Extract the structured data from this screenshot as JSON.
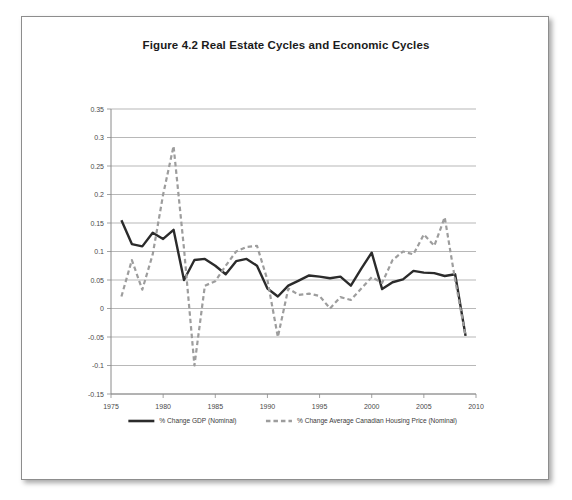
{
  "figure": {
    "title": "Figure 4.2 Real Estate Cycles and Economic Cycles"
  },
  "chart_data": {
    "type": "line",
    "title": "Figure 4.2 Real Estate Cycles and Economic Cycles",
    "xlabel": "",
    "ylabel": "",
    "xlim": [
      1975,
      2010
    ],
    "ylim": [
      -0.15,
      0.35
    ],
    "grid": true,
    "legend_position": "bottom",
    "x_ticks": [
      1975,
      1980,
      1985,
      1990,
      1995,
      2000,
      2005,
      2010
    ],
    "y_ticks": [
      -0.15,
      -0.1,
      -0.05,
      0,
      0.05,
      0.1,
      0.15,
      0.2,
      0.25,
      0.3,
      0.35
    ],
    "x": [
      1976,
      1977,
      1978,
      1979,
      1980,
      1981,
      1982,
      1983,
      1984,
      1985,
      1986,
      1987,
      1988,
      1989,
      1990,
      1991,
      1992,
      1993,
      1994,
      1995,
      1996,
      1997,
      1998,
      1999,
      2000,
      2001,
      2002,
      2003,
      2004,
      2005,
      2006,
      2007,
      2008,
      2009
    ],
    "series": [
      {
        "name": "% Change GDP (Nominal)",
        "key": "gdp",
        "color": "#2b2b2b",
        "style": "solid",
        "width": 2.4,
        "values": [
          0.155,
          0.113,
          0.109,
          0.133,
          0.122,
          0.138,
          0.05,
          0.085,
          0.087,
          0.075,
          0.06,
          0.083,
          0.087,
          0.075,
          0.035,
          0.021,
          0.04,
          0.049,
          0.058,
          0.056,
          0.053,
          0.056,
          0.04,
          0.07,
          0.098,
          0.034,
          0.046,
          0.051,
          0.066,
          0.063,
          0.062,
          0.057,
          0.06,
          -0.048
        ]
      },
      {
        "name": "% Change Average Canadian Housing Price (Nominal)",
        "key": "housing",
        "color": "#9d9d9d",
        "style": "dashed",
        "width": 2.2,
        "values": [
          0.021,
          0.085,
          0.033,
          0.095,
          0.2,
          0.285,
          0.105,
          -0.1,
          0.04,
          0.048,
          0.075,
          0.1,
          0.108,
          0.11,
          0.05,
          -0.05,
          0.035,
          0.024,
          0.026,
          0.022,
          0.0,
          0.02,
          0.015,
          0.035,
          0.055,
          0.045,
          0.085,
          0.1,
          0.095,
          0.13,
          0.11,
          0.16,
          0.05,
          -0.048
        ]
      }
    ]
  },
  "legend": {
    "items": [
      {
        "label": "% Change GDP (Nominal)",
        "style": "solid",
        "color": "#2b2b2b"
      },
      {
        "label": "% Change Average Canadian Housing Price (Nominal)",
        "style": "dashed",
        "color": "#9d9d9d"
      }
    ]
  }
}
